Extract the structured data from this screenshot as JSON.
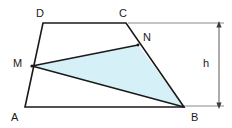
{
  "figure": {
    "kind": "geometry-diagram",
    "background_color": "#ffffff",
    "stroke_color": "#1a1a1a",
    "dimension_color": "#6e6e6e",
    "shade_color": "#d6f0f7",
    "shade_stroke": "#1a1a1a"
  },
  "labels": {
    "A": "A",
    "B": "B",
    "C": "C",
    "D": "D",
    "M": "M",
    "N": "N",
    "h": "h"
  },
  "points": {
    "A": {
      "x": 25,
      "y": 107
    },
    "B": {
      "x": 184,
      "y": 107
    },
    "C": {
      "x": 126,
      "y": 23
    },
    "D": {
      "x": 43,
      "y": 23
    },
    "M": {
      "x": 32,
      "y": 66
    },
    "N": {
      "x": 138,
      "y": 45
    }
  },
  "label_positions": {
    "A": {
      "x": 11,
      "y": 112
    },
    "B": {
      "x": 191,
      "y": 112
    },
    "C": {
      "x": 119,
      "y": 8
    },
    "D": {
      "x": 36,
      "y": 8
    },
    "M": {
      "x": 13,
      "y": 58
    },
    "N": {
      "x": 143,
      "y": 32
    },
    "h": {
      "x": 203,
      "y": 58
    }
  },
  "shapes": {
    "trapezoid": {
      "name": "trapezoid-ABCD",
      "path": "M 25 107 L 43 23 L 126 23 L 184 107 Z",
      "fill": "none"
    },
    "shaded_triangle": {
      "name": "triangle-MNB",
      "path": "M 32 66 L 138 45 L 184 107 Z",
      "fill": "#d6f0f7"
    }
  },
  "dimension": {
    "label": "h",
    "axis_x": 219,
    "top_y": 24,
    "bottom_y": 106,
    "extension_top": {
      "x1": 128,
      "y1": 23,
      "x2": 224,
      "y2": 23
    },
    "extension_bottom": {
      "x1": 184,
      "y1": 106,
      "x2": 224,
      "y2": 106
    }
  }
}
